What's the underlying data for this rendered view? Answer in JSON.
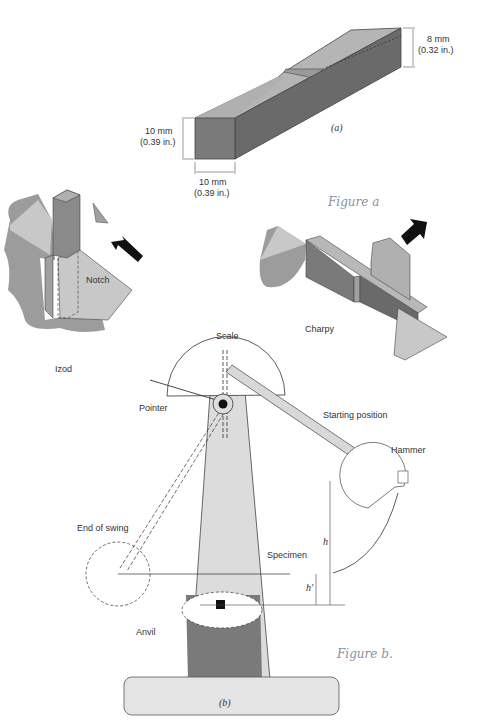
{
  "figure_a": {
    "caption": "(a)",
    "dim_height": {
      "mm": "10 mm",
      "in": "(0.39 in.)"
    },
    "dim_width": {
      "mm": "10 mm",
      "in": "(0.39 in.)"
    },
    "dim_notch_depth": {
      "mm": "8 mm",
      "in": "(0.32 in.)"
    }
  },
  "izod": {
    "label": "Izod",
    "notch_label": "Notch"
  },
  "charpy": {
    "label": "Charpy"
  },
  "figure_b": {
    "caption": "(b)",
    "labels": {
      "scale": "Scale",
      "pointer": "Pointer",
      "starting_position": "Starting position",
      "hammer": "Hammer",
      "end_of_swing": "End of swing",
      "specimen": "Specimen",
      "anvil": "Anvil",
      "h": "h",
      "h_prime": "h′"
    }
  },
  "handwritten": {
    "note_a": "Figure a",
    "note_b": "Figure b."
  },
  "colors": {
    "dark_gray": "#6e6e6e",
    "mid_gray": "#a0a0a0",
    "light_gray": "#d0d0d0",
    "base": "#e4e4e4"
  }
}
